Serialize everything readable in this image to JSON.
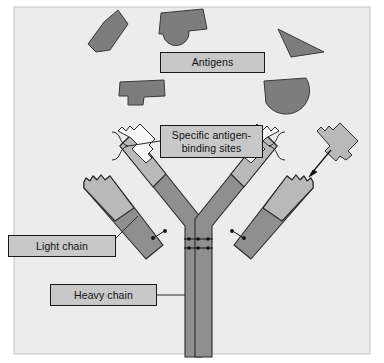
{
  "figure": {
    "type": "biological-schematic",
    "background_color": "#ececec",
    "frame_border_color": "#b8b8b8",
    "width": 384,
    "height": 363
  },
  "labels": {
    "antigens": "Antigens",
    "binding_sites": "Specific antigen-\nbinding sites",
    "light_chain": "Light chain",
    "heavy_chain": "Heavy chain"
  },
  "colors": {
    "antigen_fill": "#7d7d7d",
    "antigen_stroke": "#3a3a3a",
    "chain_light_fill": "#b9b9b9",
    "chain_dark_fill": "#8f8f8f",
    "chain_stroke": "#2b2b2b",
    "binding_site_fill": "#f4f4f4",
    "label_fill": "#c8c8c8",
    "label_stroke": "#1a1a1a",
    "leader_line": "#2b2b2b",
    "disulfide": "#111111"
  },
  "antigens": [
    {
      "name": "antigen-upper-left-wedge",
      "shape": "angled-block",
      "fill": "#7d7d7d"
    },
    {
      "name": "antigen-top-center-knob",
      "shape": "rectangle-with-round-lobe",
      "fill": "#7d7d7d"
    },
    {
      "name": "antigen-top-right-triangle",
      "shape": "triangle",
      "fill": "#7d7d7d"
    },
    {
      "name": "antigen-mid-left-tab",
      "shape": "rectangle-with-tab",
      "fill": "#7d7d7d"
    },
    {
      "name": "antigen-mid-right-halfdisc",
      "shape": "half-disc",
      "fill": "#7d7d7d"
    },
    {
      "name": "antigen-matching-right",
      "shape": "notched-block-matching-binding-site",
      "fill": "#b9b9b9"
    }
  ],
  "antibody": {
    "name": "antibody-y-shape",
    "parts": [
      {
        "name": "heavy-chain-left",
        "description": "left heavy chain arm and stem"
      },
      {
        "name": "heavy-chain-right",
        "description": "right heavy chain arm and stem"
      },
      {
        "name": "light-chain-left",
        "description": "left outer light chain"
      },
      {
        "name": "light-chain-right",
        "description": "right outer light chain"
      },
      {
        "name": "binding-site-left",
        "description": "notched variable region, left arm tip"
      },
      {
        "name": "binding-site-right",
        "description": "notched variable region, right arm tip"
      },
      {
        "name": "disulfide-bonds-hinge",
        "count": 2,
        "description": "paired dotted bonds joining heavy chains at hinge"
      },
      {
        "name": "disulfide-bond-left-light-heavy",
        "count": 1
      },
      {
        "name": "disulfide-bond-right-light-heavy",
        "count": 1
      }
    ]
  },
  "annotations": {
    "arrow_to_binding_site": "arrow from matching antigen toward right binding site",
    "brace_left": "curly brace from left binding site to label",
    "brace_right": "curly brace from right binding site to label",
    "leader_light_chain": "line from Light chain box to left light chain",
    "leader_heavy_chain": "line from Heavy chain box to left heavy chain stem"
  }
}
